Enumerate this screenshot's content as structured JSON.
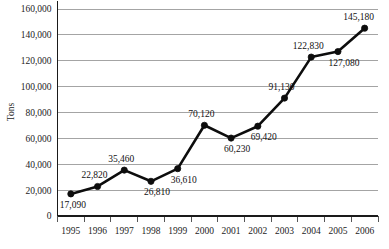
{
  "chart_data": {
    "type": "line",
    "title": "",
    "xlabel": "",
    "ylabel": "Tons",
    "categories": [
      "1995",
      "1996",
      "1997",
      "1998",
      "1999",
      "2000",
      "2001",
      "2002",
      "2003",
      "2004",
      "2005",
      "2006"
    ],
    "values": [
      17090,
      22820,
      35460,
      26810,
      36610,
      70120,
      60230,
      69420,
      91130,
      122830,
      127080,
      145180
    ],
    "point_labels": [
      "17,090",
      "22,820",
      "35,460",
      "26,810",
      "36,610",
      "70,120",
      "60,230",
      "69,420",
      "91,130",
      "122,830",
      "127,080",
      "145,180"
    ],
    "point_label_positions": [
      "below",
      "above",
      "above",
      "below",
      "below",
      "above",
      "below",
      "below",
      "above",
      "above",
      "below",
      "above"
    ],
    "ylim": [
      0,
      160000
    ],
    "ytick_values": [
      0,
      20000,
      40000,
      60000,
      80000,
      100000,
      120000,
      140000,
      160000
    ],
    "ytick_labels": [
      "0",
      "20,000",
      "40,000",
      "60,000",
      "80,000",
      "100,000",
      "120,000",
      "140,000",
      "160,000"
    ],
    "grid": true,
    "grid_axis": "y",
    "legend": false,
    "legend_position": "none",
    "series": [
      {
        "name": "Tons",
        "color": "#0d0d0d",
        "marker": "circle",
        "values": [
          17090,
          22820,
          35460,
          26810,
          36610,
          70120,
          60230,
          69420,
          91130,
          122830,
          127080,
          145180
        ]
      }
    ],
    "colors": {
      "series": "#0d0d0d",
      "grid": "#9a9a9a",
      "axis": "#1a1a1a",
      "text": "#1c1c1c",
      "background": "#ffffff"
    }
  }
}
